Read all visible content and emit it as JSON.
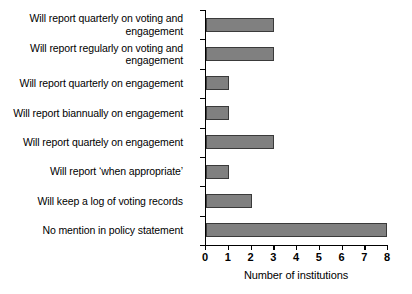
{
  "chart_data": {
    "type": "bar",
    "orientation": "horizontal",
    "title": "",
    "xlabel": "Number of institutions",
    "ylabel": "",
    "xlim": [
      0,
      8
    ],
    "xticks": [
      0,
      1,
      2,
      3,
      4,
      5,
      6,
      7,
      8
    ],
    "grid": false,
    "legend": false,
    "bar_color": "#808080",
    "bar_edge_color": "#3a3a3a",
    "categories": [
      "Will report quarterly on voting and\nengagement",
      "Will report regularly on voting and\nengagement",
      "Will report quarterly on engagement",
      "Will report biannually on engagement",
      "Will report quartely on engagement",
      "Will report ‘when appropriate’",
      "Will keep a log of voting records",
      "No mention in policy statement"
    ],
    "values": [
      3,
      3,
      1,
      1,
      3,
      1,
      2,
      8
    ]
  }
}
